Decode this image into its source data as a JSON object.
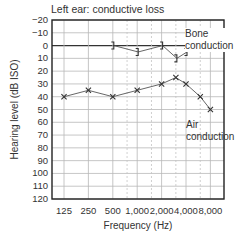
{
  "chart_data": {
    "type": "line",
    "title": "Left ear: conductive loss",
    "xlabel": "Frequency (Hz)",
    "ylabel": "Hearing level (dB ISO)",
    "x_scale": "log2",
    "categories": [
      "125",
      "250",
      "500",
      "1,000",
      "2,000",
      "4,000",
      "8,000"
    ],
    "y_ticks": [
      "-20",
      "-10",
      "0",
      "10",
      "20",
      "30",
      "40",
      "50",
      "60",
      "70",
      "80",
      "90",
      "100",
      "110",
      "120"
    ],
    "ylim": [
      120,
      -20
    ],
    "y_inverted": true,
    "grid": true,
    "intermediate_frequencies_dashed": [
      750,
      1500,
      3000,
      6000
    ],
    "series": [
      {
        "name": "Air conduction",
        "marker": "x",
        "x": [
          125,
          250,
          500,
          1000,
          2000,
          3000,
          4000,
          6000,
          8000
        ],
        "values": [
          40,
          35,
          40,
          35,
          30,
          25,
          30,
          40,
          50
        ]
      },
      {
        "name": "Bone conduction",
        "marker": "]",
        "x": [
          500,
          1000,
          2000,
          3000,
          4000
        ],
        "values": [
          0,
          5,
          0,
          10,
          5
        ]
      }
    ],
    "annotations": [
      {
        "text": "Bone conduction",
        "position": "upper right"
      },
      {
        "text": "Air conduction",
        "position": "right, below air line"
      }
    ]
  },
  "labels": {
    "title": "Left ear: conductive loss",
    "xlabel": "Frequency (Hz)",
    "ylabel": "Hearing level (dB ISO)",
    "bone_line1": "Bone",
    "bone_line2": "conduction",
    "air_line1": "Air",
    "air_line2": "conduction"
  },
  "ticks": {
    "y": [
      "−20",
      "−10",
      "0",
      "10",
      "20",
      "30",
      "40",
      "50",
      "60",
      "70",
      "80",
      "90",
      "100",
      "110",
      "120"
    ],
    "x": [
      "125",
      "250",
      "500",
      "1,000",
      "2,000",
      "4,000",
      "8,000"
    ]
  }
}
